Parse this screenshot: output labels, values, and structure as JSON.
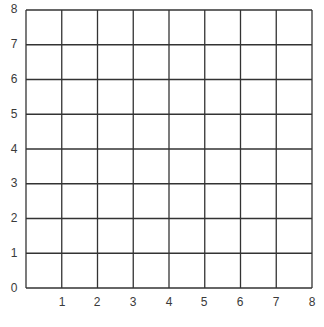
{
  "chart_data": {
    "type": "grid",
    "title": "",
    "xlabel": "",
    "ylabel": "",
    "xlim": [
      0,
      8
    ],
    "ylim": [
      0,
      8
    ],
    "grid": true,
    "x_ticks": [
      "1",
      "2",
      "3",
      "4",
      "5",
      "6",
      "7",
      "8"
    ],
    "y_ticks": [
      "0",
      "1",
      "2",
      "3",
      "4",
      "5",
      "6",
      "7",
      "8"
    ],
    "series": [],
    "line_color": "#333333",
    "label_color": "#3a3a3a"
  }
}
